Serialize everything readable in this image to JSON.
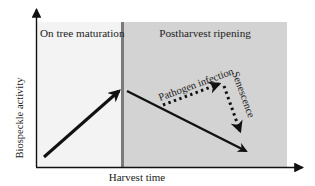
{
  "diagram": {
    "y_axis_label": "Biospeckle activity",
    "x_axis_label": "Harvest time",
    "regions": [
      {
        "name": "on-tree",
        "label": "On tree maturation",
        "color": "#f3f3f3"
      },
      {
        "name": "postharvest",
        "label": "Postharvest ripening",
        "color": "#d3d3d3"
      }
    ],
    "divider_color": "#7a7a7a",
    "arrow_labels": {
      "pathogen": "Pathogen infection",
      "senescence": "Senescence"
    },
    "arrows": [
      {
        "name": "maturation-rise",
        "style": "solid",
        "trend": "increase"
      },
      {
        "name": "ripening-decline",
        "style": "solid",
        "trend": "decrease"
      },
      {
        "name": "pathogen-infection",
        "style": "dotted",
        "trend": "increase"
      },
      {
        "name": "senescence-decline",
        "style": "dotted",
        "trend": "decrease"
      }
    ]
  }
}
